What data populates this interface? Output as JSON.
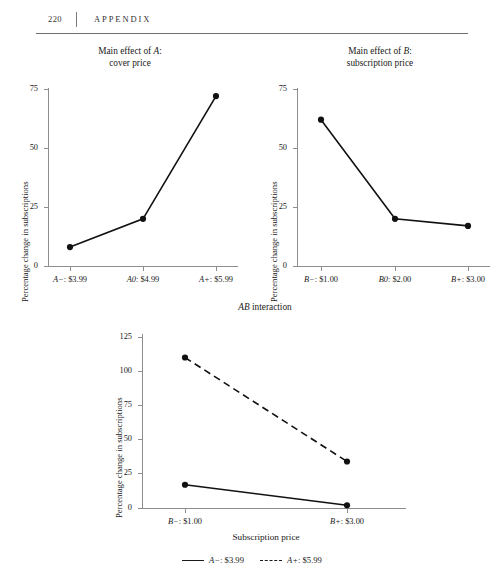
{
  "page": {
    "folio": "220",
    "running_title": "APPENDIX"
  },
  "charts": {
    "a": {
      "title_line1_prefix": "Main effect of ",
      "title_line1_italic": "A",
      "title_line1_suffix": ":",
      "title_line2": "cover price",
      "ylabel": "Percentage change in subscriptions",
      "yticks": [
        "0",
        "25",
        "50",
        "75"
      ],
      "xticks": [
        {
          "italic": "A−",
          "rest": ": $3.99"
        },
        {
          "italic": "A0",
          "rest": ": $4.99"
        },
        {
          "italic": "A+",
          "rest": ": $5.99"
        }
      ]
    },
    "b": {
      "title_line1_prefix": "Main effect of ",
      "title_line1_italic": "B",
      "title_line1_suffix": ":",
      "title_line2": "subscription price",
      "ylabel": "Percentage change in subscriptions",
      "yticks": [
        "0",
        "25",
        "50",
        "75"
      ],
      "xticks": [
        {
          "italic": "B−",
          "rest": ": $1.00"
        },
        {
          "italic": "B0",
          "rest": ": $2.00"
        },
        {
          "italic": "B+",
          "rest": ": $3.00"
        }
      ]
    },
    "ab": {
      "title_italic": "AB",
      "title_rest": " interaction",
      "ylabel": "Percentage change in subscriptions",
      "xlabel": "Subscription price",
      "yticks": [
        "0",
        "25",
        "50",
        "75",
        "100",
        "125"
      ],
      "xticks": [
        {
          "italic": "B−",
          "rest": ": $1.00"
        },
        {
          "italic": "B+",
          "rest": ": $3.00"
        }
      ],
      "legend": [
        {
          "style": "solid",
          "italic": "A−",
          "rest": ": $3.99"
        },
        {
          "style": "dashed",
          "italic": "A+",
          "rest": ": $5.99"
        }
      ]
    }
  },
  "chart_data": [
    {
      "id": "main-effect-a",
      "type": "line",
      "title": "Main effect of A: cover price",
      "xlabel": "",
      "ylabel": "Percentage change in subscriptions",
      "categories": [
        "A−: $3.99",
        "A0: $4.99",
        "A+: $5.99"
      ],
      "values": [
        8,
        20,
        72
      ],
      "ylim": [
        0,
        75
      ],
      "yticks": [
        0,
        25,
        50,
        75
      ],
      "grid": false,
      "markers": "filled-circle",
      "line_style": "solid",
      "legend": "none"
    },
    {
      "id": "main-effect-b",
      "type": "line",
      "title": "Main effect of B: subscription price",
      "xlabel": "",
      "ylabel": "Percentage change in subscriptions",
      "categories": [
        "B−: $1.00",
        "B0: $2.00",
        "B+: $3.00"
      ],
      "values": [
        62,
        20,
        17
      ],
      "ylim": [
        0,
        75
      ],
      "yticks": [
        0,
        25,
        50,
        75
      ],
      "grid": false,
      "markers": "filled-circle",
      "line_style": "solid",
      "legend": "none"
    },
    {
      "id": "ab-interaction",
      "type": "line",
      "title": "AB interaction",
      "xlabel": "Subscription price",
      "ylabel": "Percentage change in subscriptions",
      "categories": [
        "B−: $1.00",
        "B+: $3.00"
      ],
      "series": [
        {
          "name": "A−: $3.99",
          "values": [
            17,
            2
          ],
          "line_style": "solid"
        },
        {
          "name": "A+: $5.99",
          "values": [
            110,
            34
          ],
          "line_style": "dashed"
        }
      ],
      "ylim": [
        0,
        125
      ],
      "yticks": [
        0,
        25,
        50,
        75,
        100,
        125
      ],
      "grid": false,
      "markers": "filled-circle",
      "legend": "bottom-center"
    }
  ]
}
